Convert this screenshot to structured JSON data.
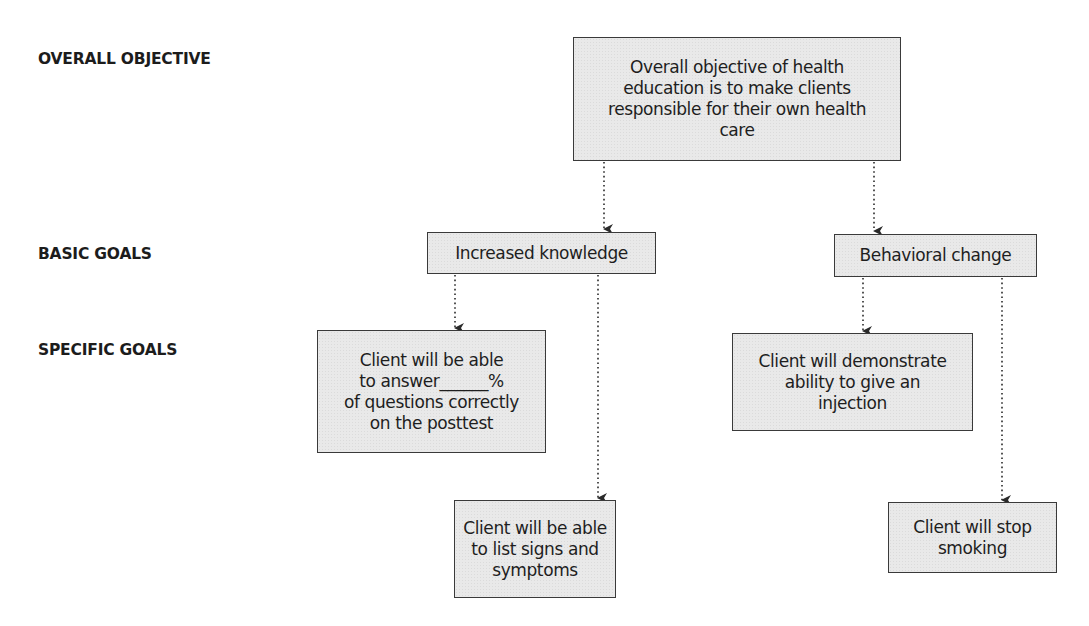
{
  "levels": {
    "overall": "OVERALL OBJECTIVE",
    "basic": "BASIC GOALS",
    "specific": "SPECIFIC GOALS"
  },
  "nodes": {
    "objective": {
      "lines": [
        "Overall objective of health",
        "education is to make clients",
        "responsible for their own health",
        "care"
      ]
    },
    "knowledge": {
      "label": "Increased knowledge"
    },
    "behavior": {
      "label": "Behavioral change"
    },
    "answer_questions": {
      "lines": [
        "Client will be able",
        "to answer______%",
        "of questions correctly",
        "on the posttest"
      ]
    },
    "list_signs": {
      "lines": [
        "Client will be able",
        "to list signs and",
        "symptoms"
      ]
    },
    "injection": {
      "lines": [
        "Client will demonstrate",
        "ability to give an",
        "injection"
      ]
    },
    "stop_smoking": {
      "lines": [
        "Client will stop",
        "smoking"
      ]
    }
  },
  "edges": [
    {
      "from": "objective",
      "to": "knowledge"
    },
    {
      "from": "objective",
      "to": "behavior"
    },
    {
      "from": "knowledge",
      "to": "answer_questions"
    },
    {
      "from": "knowledge",
      "to": "list_signs"
    },
    {
      "from": "behavior",
      "to": "injection"
    },
    {
      "from": "behavior",
      "to": "stop_smoking"
    }
  ],
  "colors": {
    "box_fill": "#e9e9e9",
    "box_border": "#3a3a3a",
    "text": "#1e1e1e",
    "arrow": "#2a2a2a"
  }
}
